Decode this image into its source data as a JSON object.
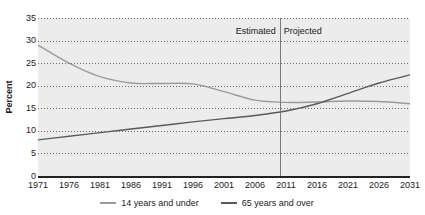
{
  "chart_data": {
    "type": "line",
    "title": "",
    "xlabel": "",
    "ylabel": "Percent",
    "ylim": [
      0,
      35
    ],
    "yticks": [
      0,
      5,
      10,
      15,
      20,
      25,
      30,
      35
    ],
    "xlim": [
      1971,
      2031
    ],
    "x": [
      1971,
      1976,
      1981,
      1986,
      1991,
      1996,
      2001,
      2006,
      2011,
      2016,
      2021,
      2026,
      2031
    ],
    "xticks": [
      "1971",
      "1976",
      "1981",
      "1986",
      "1991",
      "1996",
      "2001",
      "2006",
      "2011",
      "2016",
      "2021",
      "2026",
      "2031"
    ],
    "grid": true,
    "grid_orientation": "horizontal",
    "legend_position": "bottom",
    "series": [
      {
        "name": "14 years and under",
        "color": "#9a9a9a",
        "values": [
          29.0,
          25.0,
          22.0,
          20.6,
          20.5,
          20.4,
          18.7,
          16.8,
          16.3,
          16.4,
          16.6,
          16.5,
          16.0
        ]
      },
      {
        "name": "65 years and over",
        "color": "#5a5a5a",
        "values": [
          8.0,
          8.8,
          9.6,
          10.4,
          11.2,
          12.0,
          12.7,
          13.4,
          14.4,
          16.0,
          18.3,
          20.6,
          22.4
        ]
      }
    ],
    "annotations": [
      {
        "name": "estimated-label",
        "text": "Estimated",
        "at_x": 2010,
        "align": "right"
      },
      {
        "name": "projected-label",
        "text": "Projected",
        "at_x": 2010,
        "align": "left"
      }
    ],
    "divider": {
      "at_x": 2010,
      "color": "#7a7a7a"
    },
    "plot_background": "#ececec",
    "axis_color": "#222222"
  }
}
